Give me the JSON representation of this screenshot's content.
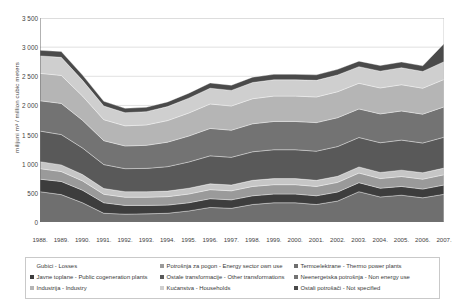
{
  "chart_data": {
    "type": "area",
    "stacked": true,
    "title": "",
    "xlabel": "",
    "ylabel": "milijuni m³ / million cubic meters",
    "ylim": [
      0,
      3500
    ],
    "ytick_labels": [
      "0",
      "500",
      "1 000",
      "1 500",
      "2 000",
      "2 500",
      "3 000",
      "3 500"
    ],
    "ytick_values": [
      0,
      500,
      1000,
      1500,
      2000,
      2500,
      3000,
      3500
    ],
    "grid": true,
    "legend_position": "bottom",
    "categories": [
      "1988.",
      "1989.",
      "1990.",
      "1991.",
      "1992.",
      "1993.",
      "1994.",
      "1995.",
      "1996.",
      "1997.",
      "1998.",
      "1999.",
      "2000.",
      "2001.",
      "2002.",
      "2003.",
      "2004.",
      "2005.",
      "2006.",
      "2007."
    ],
    "series": [
      {
        "name": "Termoelektrane - Thermo power plants",
        "color": "#6f6f6f",
        "values": [
          520,
          470,
          330,
          150,
          135,
          140,
          150,
          190,
          250,
          235,
          300,
          330,
          330,
          300,
          360,
          520,
          430,
          460,
          415,
          475
        ]
      },
      {
        "name": "Javne toplane - Public cogeneration plants",
        "color": "#3d3d3d",
        "values": [
          215,
          225,
          215,
          180,
          150,
          145,
          140,
          140,
          150,
          145,
          150,
          150,
          150,
          150,
          155,
          155,
          150,
          150,
          150,
          160
        ]
      },
      {
        "name": "Potrošnja za pogon - Energy sector own use",
        "color": "#9a9a9a",
        "values": [
          180,
          170,
          160,
          145,
          140,
          140,
          145,
          150,
          155,
          155,
          160,
          160,
          160,
          160,
          165,
          165,
          165,
          170,
          170,
          175
        ]
      },
      {
        "name": "Gubici - Losses",
        "color": "#c6c6c6",
        "values": [
          120,
          115,
          110,
          100,
          95,
          95,
          95,
          100,
          100,
          100,
          105,
          105,
          105,
          105,
          105,
          105,
          105,
          110,
          110,
          115
        ]
      },
      {
        "name": "Ostale transformacije - Other transformations",
        "color": "#595959",
        "values": [
          525,
          520,
          455,
          410,
          395,
          400,
          420,
          450,
          480,
          475,
          490,
          495,
          495,
          500,
          510,
          505,
          510,
          515,
          510,
          530
        ]
      },
      {
        "name": "Neenergetska potrošnja - Non energy use",
        "color": "#737373",
        "values": [
          520,
          535,
          475,
          410,
          390,
          395,
          420,
          445,
          470,
          465,
          480,
          485,
          485,
          490,
          495,
          490,
          495,
          500,
          495,
          520
        ]
      },
      {
        "name": "Industrija - Industry",
        "color": "#b5b5b5",
        "values": [
          470,
          480,
          415,
          360,
          345,
          350,
          370,
          395,
          420,
          415,
          430,
          435,
          435,
          440,
          445,
          440,
          445,
          450,
          445,
          470
        ]
      },
      {
        "name": "Kućanstva - Households",
        "color": "#cfcfcf",
        "values": [
          300,
          310,
          270,
          235,
          225,
          228,
          240,
          255,
          270,
          268,
          278,
          280,
          280,
          285,
          288,
          285,
          288,
          292,
          288,
          305
        ]
      },
      {
        "name": "Ostali potrošači - Not specified",
        "color": "#4a4a4a",
        "values": [
          95,
          100,
          90,
          80,
          75,
          75,
          80,
          85,
          90,
          88,
          92,
          93,
          93,
          95,
          96,
          95,
          96,
          98,
          96,
          310
        ]
      }
    ]
  },
  "legend": {
    "columns": [
      [
        {
          "label": "Gubici - Losses",
          "color": "#c6c6c6",
          "show_swatch": false
        },
        {
          "label": "Javne toplane - Public cogeneration plants",
          "color": "#3d3d3d",
          "show_swatch": true
        },
        {
          "label": "Industrija - Industry",
          "color": "#b5b5b5",
          "show_swatch": true
        }
      ],
      [
        {
          "label": "Potrošnja za pogon - Energy sector own use",
          "color": "#9a9a9a",
          "show_swatch": true
        },
        {
          "label": "Ostale transformacije - Other transformations",
          "color": "#595959",
          "show_swatch": true
        },
        {
          "label": "Kućanstva - Households",
          "color": "#cfcfcf",
          "show_swatch": true
        }
      ],
      [
        {
          "label": "Termoelektrane - Thermo power plants",
          "color": "#6f6f6f",
          "show_swatch": true
        },
        {
          "label": "Neenergetska potrošnja - Non energy use",
          "color": "#737373",
          "show_swatch": true
        },
        {
          "label": "Ostali potrošači - Not specified",
          "color": "#4a4a4a",
          "show_swatch": true
        }
      ]
    ]
  }
}
